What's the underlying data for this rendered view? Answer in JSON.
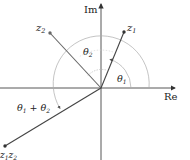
{
  "diagram": {
    "axes": {
      "real_label": "Re",
      "imag_label": "Im"
    },
    "points": [
      {
        "id": "z1",
        "label_main": "z",
        "label_sub": "1"
      },
      {
        "id": "z2",
        "label_main": "z",
        "label_sub": "2"
      },
      {
        "id": "z1z2",
        "label_main": "z",
        "label_sub": "1",
        "label_main2": "z",
        "label_sub2": "2"
      }
    ],
    "angles": {
      "theta1": {
        "main": "θ",
        "sub": "1"
      },
      "theta2": {
        "main": "θ",
        "sub": "2"
      },
      "sum": {
        "main1": "θ",
        "sub1": "1",
        "plus": " + ",
        "main2": "θ",
        "sub2": "2"
      }
    },
    "colors": {
      "axis": "#333333",
      "vector": "#444444",
      "arc": "#aaaaaa",
      "point": "#333333"
    }
  }
}
